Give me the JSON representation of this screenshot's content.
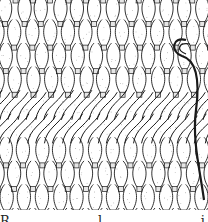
{
  "figure": {
    "type": "line-drawing",
    "stroke_color": "#1a1a1a",
    "background_color": "#ffffff",
    "columns": 11,
    "rows": 9,
    "diagonal_band_rows": [
      4,
      5
    ]
  },
  "caption": {
    "text": "R . . . . . . . . l . . . . . . . . . i . . . . . t . . . . . i",
    "note_visible": "caption cropped; only tops of letters visible"
  }
}
